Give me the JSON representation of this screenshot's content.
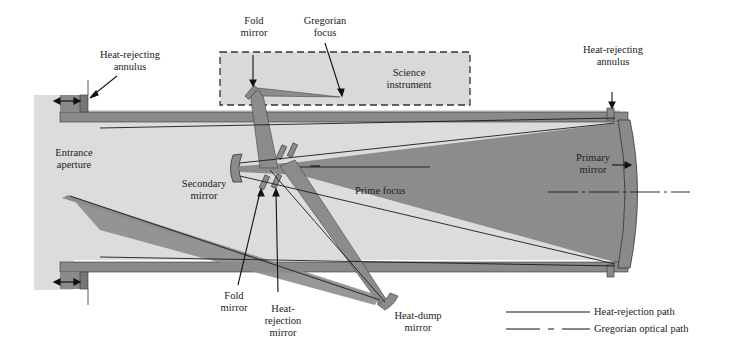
{
  "colors": {
    "tube_fill": "#dcdcdc",
    "beam_fill": "#8c8c8c",
    "structure_fill": "#8a8a8a",
    "instrument_fill": "#d9d9d9",
    "line": "#1a1a1a",
    "background": "#ffffff"
  },
  "labels": {
    "heat_rejecting_annulus_left": "Heat-rejecting\nannulus",
    "fold_mirror_top": "Fold\nmirror",
    "gregorian_focus": "Gregorian\nfocus",
    "science_instrument": "Science\ninstrument",
    "heat_rejecting_annulus_right": "Heat-rejecting\nannulus",
    "entrance_aperture": "Entrance\naperture",
    "primary_mirror": "Primary\nmirror",
    "secondary_mirror": "Secondary\nmirror",
    "prime_focus": "Prime focus",
    "fold_mirror_bottom": "Fold\nmirror",
    "heat_rejection_mirror": "Heat-\nrejection\nmirror",
    "heat_dump_mirror": "Heat-dump\nmirror"
  },
  "legend": {
    "items": [
      {
        "label": "Heat-rejection path",
        "style": "solid"
      },
      {
        "label": "Gregorian optical path",
        "style": "dash-dot"
      }
    ]
  }
}
